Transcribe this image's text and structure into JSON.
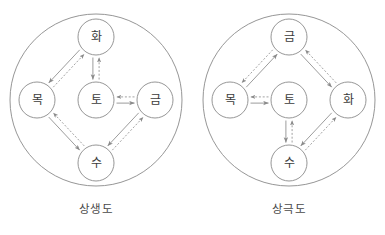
{
  "page": {
    "background_color": "#ffffff",
    "stroke_color": "#8a8a8a",
    "text_color": "#3c3c3c",
    "width": 385,
    "height": 235
  },
  "diagrams": [
    {
      "id": "sangsaengdo",
      "caption": "상생도",
      "outer_circle": {
        "cx": 96,
        "cy": 100,
        "r": 86
      },
      "nodes": [
        {
          "id": "top",
          "label": "화",
          "cx": 96,
          "cy": 37,
          "r": 18
        },
        {
          "id": "left",
          "label": "목",
          "cx": 37,
          "cy": 100,
          "r": 18
        },
        {
          "id": "center",
          "label": "토",
          "cx": 96,
          "cy": 100,
          "r": 18
        },
        {
          "id": "right",
          "label": "금",
          "cx": 155,
          "cy": 100,
          "r": 18
        },
        {
          "id": "bottom",
          "label": "수",
          "cx": 96,
          "cy": 163,
          "r": 18
        }
      ],
      "connections": [
        {
          "from": "top",
          "to": "left",
          "solid_direction": "to",
          "dashed_direction": "from"
        },
        {
          "from": "top",
          "to": "center",
          "solid_direction": "to",
          "dashed_direction": "from"
        },
        {
          "from": "center",
          "to": "right",
          "solid_direction": "to",
          "dashed_direction": "from"
        },
        {
          "from": "right",
          "to": "bottom",
          "solid_direction": "to",
          "dashed_direction": "from"
        },
        {
          "from": "left",
          "to": "bottom",
          "solid_direction": "to",
          "dashed_direction": "from"
        }
      ]
    },
    {
      "id": "sanggeukdo",
      "caption": "상극도",
      "outer_circle": {
        "cx": 96,
        "cy": 100,
        "r": 86
      },
      "nodes": [
        {
          "id": "top",
          "label": "금",
          "cx": 96,
          "cy": 37,
          "r": 18
        },
        {
          "id": "left",
          "label": "목",
          "cx": 37,
          "cy": 100,
          "r": 18
        },
        {
          "id": "center",
          "label": "토",
          "cx": 96,
          "cy": 100,
          "r": 18
        },
        {
          "id": "right",
          "label": "화",
          "cx": 155,
          "cy": 100,
          "r": 18
        },
        {
          "id": "bottom",
          "label": "수",
          "cx": 96,
          "cy": 163,
          "r": 18
        }
      ],
      "connections": [
        {
          "from": "left",
          "to": "top",
          "solid_direction": "to",
          "dashed_direction": "from"
        },
        {
          "from": "top",
          "to": "right",
          "solid_direction": "to",
          "dashed_direction": "from"
        },
        {
          "from": "left",
          "to": "center",
          "solid_direction": "to",
          "dashed_direction": "from"
        },
        {
          "from": "center",
          "to": "bottom",
          "solid_direction": "to",
          "dashed_direction": "from"
        },
        {
          "from": "right",
          "to": "bottom",
          "solid_direction": "to",
          "dashed_direction": "from"
        }
      ]
    }
  ]
}
